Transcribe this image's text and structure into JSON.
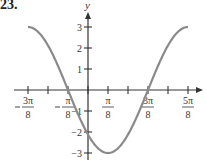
{
  "problem_number": "23.",
  "chart_data": {
    "type": "line",
    "title": "",
    "function": "y = -3cos(2x - pi/4)",
    "xlabel": "",
    "ylabel": "y",
    "x_range": [
      -0.375,
      0.625
    ],
    "x_range_units": "pi",
    "ylim": [
      -3,
      3
    ],
    "x_ticks": [
      -0.375,
      -0.25,
      -0.125,
      0,
      0.125,
      0.25,
      0.375,
      0.5,
      0.625
    ],
    "x_tick_labels": [
      {
        "value": -0.375,
        "num": "3π",
        "den": "8",
        "neg": true
      },
      {
        "value": -0.125,
        "num": "π",
        "den": "8",
        "neg": true
      },
      {
        "value": 0.125,
        "num": "π",
        "den": "8",
        "neg": false
      },
      {
        "value": 0.375,
        "num": "3π",
        "den": "8",
        "neg": false
      },
      {
        "value": 0.625,
        "num": "5π",
        "den": "8",
        "neg": false
      }
    ],
    "y_ticks": [
      3,
      2,
      1,
      -1,
      -2,
      -3
    ],
    "y_tick_labels": [
      "3",
      "2",
      "1",
      "-1",
      "-2",
      "-3"
    ],
    "key_points": [
      {
        "x": "-3π/8",
        "y": 3
      },
      {
        "x": "-π/8",
        "y": 0
      },
      {
        "x": "0",
        "y": -2.12
      },
      {
        "x": "π/8",
        "y": -3
      },
      {
        "x": "3π/8",
        "y": 0
      },
      {
        "x": "5π/8",
        "y": 3
      }
    ],
    "grid": false,
    "legend": null,
    "colors": {
      "curve": "#8a8a8a",
      "axis": "#333333",
      "text": "#333333"
    }
  }
}
